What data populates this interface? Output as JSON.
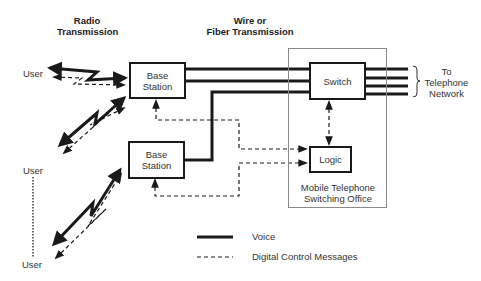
{
  "headers": {
    "radio": [
      "Radio",
      "Transmission"
    ],
    "wire": [
      "Wire or",
      "Fiber Transmission"
    ]
  },
  "users": [
    "User",
    "User",
    "User"
  ],
  "base_stations": [
    {
      "line1": "Base",
      "line2": "Station"
    },
    {
      "line1": "Base",
      "line2": "Station"
    }
  ],
  "mtso": {
    "label_line1": "Mobile Telephone",
    "label_line2": "Switching Office",
    "switch_label": "Switch",
    "logic_label": "Logic"
  },
  "network": [
    "To",
    "Telephone",
    "Network"
  ],
  "legend": {
    "voice": "Voice",
    "control": "Digital Control Messages"
  },
  "colors": {
    "line": "#1a1a1a",
    "frame": "#8a8a8a"
  }
}
